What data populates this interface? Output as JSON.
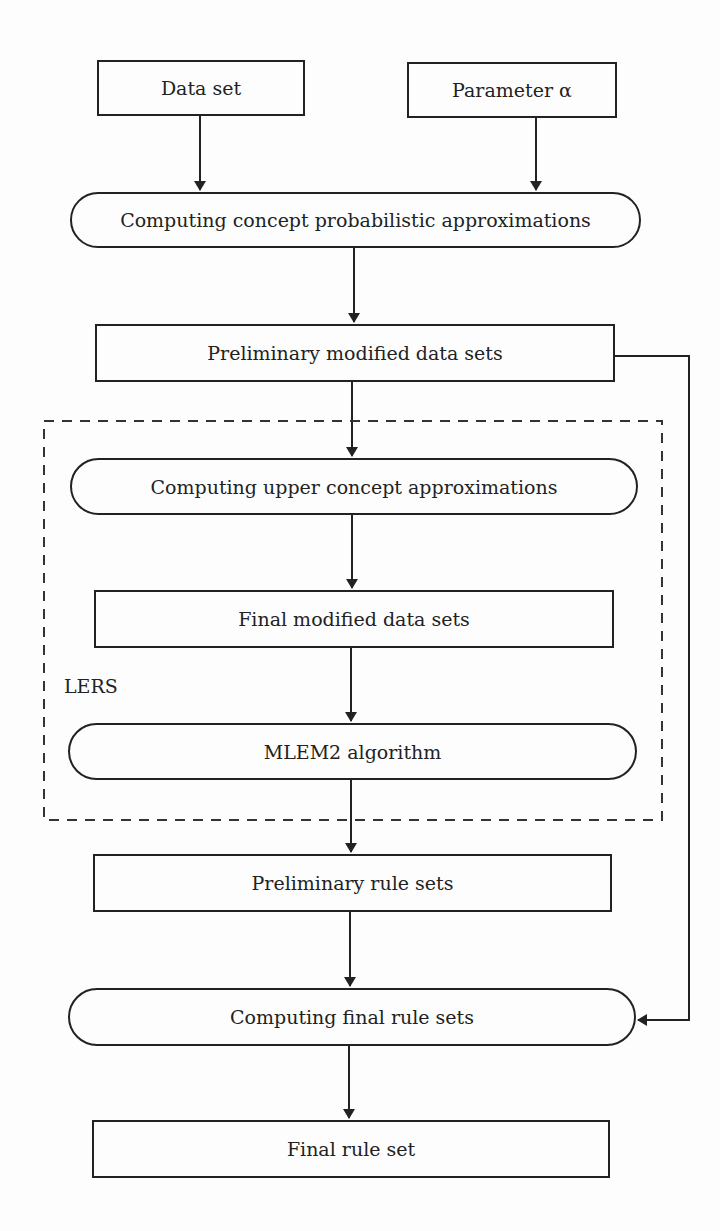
{
  "nodes": {
    "data_set": "Data set",
    "parameter": "Parameter α",
    "computing_prob_approx": "Computing concept probabilistic approximations",
    "prelim_modified": "Preliminary modified data sets",
    "computing_upper_approx": "Computing upper concept approximations",
    "final_modified": "Final modified data sets",
    "mlem2": "MLEM2 algorithm",
    "prelim_rules": "Preliminary rule sets",
    "computing_final_rules": "Computing final rule sets",
    "final_rule_set": "Final rule set"
  },
  "group": {
    "label": "LERS"
  }
}
